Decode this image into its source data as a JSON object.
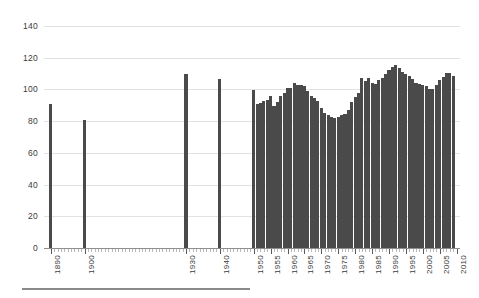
{
  "chart_data": {
    "type": "bar",
    "title": "",
    "subtitle": "",
    "xlabel": "",
    "ylabel": "",
    "ylim": [
      0,
      140
    ],
    "ytick_values": [
      0,
      20,
      40,
      60,
      80,
      100,
      120,
      140
    ],
    "ytick_labels": [
      "0",
      "20",
      "40",
      "60",
      "80",
      "100",
      "120",
      "140"
    ],
    "xtick_labels": [
      "1890",
      "1900",
      "1930",
      "1940",
      "1950",
      "1955",
      "1960",
      "1965",
      "1970",
      "1975",
      "1980",
      "1985",
      "1990",
      "1995",
      "2000",
      "2005",
      "2010"
    ],
    "xlim": [
      1888,
      2011
    ],
    "grid": "horizontal",
    "legend": "none",
    "bar_color": "#4a4a4a",
    "gridline_color": "#e2e2e2",
    "axis_color": "#8e8e8e",
    "categories": [
      1890,
      1900,
      1930,
      1940,
      1950,
      1951,
      1952,
      1953,
      1954,
      1955,
      1956,
      1957,
      1958,
      1959,
      1960,
      1961,
      1962,
      1963,
      1964,
      1965,
      1966,
      1967,
      1968,
      1969,
      1970,
      1971,
      1972,
      1973,
      1974,
      1975,
      1976,
      1977,
      1978,
      1979,
      1980,
      1981,
      1982,
      1983,
      1984,
      1985,
      1986,
      1987,
      1988,
      1989,
      1990,
      1991,
      1992,
      1993,
      1994,
      1995,
      1996,
      1997,
      1998,
      1999,
      2000,
      2001,
      2002,
      2003,
      2004,
      2005,
      2006,
      2007,
      2008,
      2009
    ],
    "values": [
      91,
      81,
      110,
      106.5,
      99.5,
      91,
      91.5,
      92.5,
      93.5,
      96,
      89.5,
      92,
      96,
      97.5,
      101,
      101,
      104,
      103,
      102.5,
      102,
      99,
      96,
      94.5,
      92.5,
      88,
      85,
      84,
      82.5,
      82,
      82.5,
      84,
      84.5,
      87,
      92,
      95.5,
      98,
      107,
      105.5,
      107,
      104,
      103.5,
      106,
      107.5,
      110,
      112.5,
      114,
      115.5,
      113.5,
      111,
      110,
      108.5,
      106.5,
      104,
      103.5,
      102.5,
      102,
      100.5,
      100,
      103,
      106,
      108,
      110.5,
      110.5,
      108.5
    ]
  }
}
